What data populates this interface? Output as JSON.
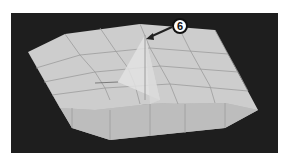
{
  "viewport": {
    "background_color": "#1e1e1e",
    "mesh_color": "#c8c8c8",
    "mesh_side_color": "#b4b4b4",
    "grid_line_color": "#9a9a9a"
  },
  "callout": {
    "number": "6",
    "arrow_color": "#222222"
  }
}
